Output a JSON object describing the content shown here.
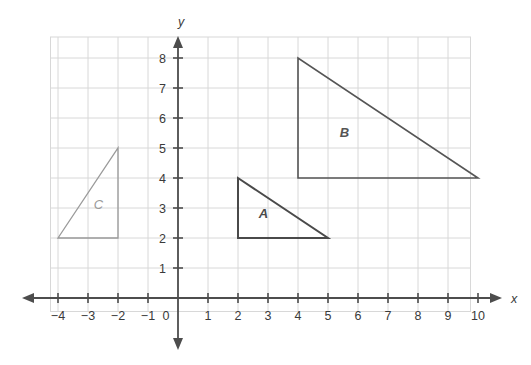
{
  "chart_data": {
    "type": "scatter",
    "title": "",
    "xlabel": "x",
    "ylabel": "y",
    "xlim": [
      -4,
      10
    ],
    "ylim": [
      0,
      8
    ],
    "grid": true,
    "legend": "none",
    "x_ticks": [
      "−4",
      "−3",
      "−2",
      "−1",
      "0",
      "1",
      "2",
      "3",
      "4",
      "5",
      "6",
      "7",
      "8",
      "9",
      "10"
    ],
    "x_tick_values": [
      -4,
      -3,
      -2,
      -1,
      0,
      1,
      2,
      3,
      4,
      5,
      6,
      7,
      8,
      9,
      10
    ],
    "y_ticks": [
      "1",
      "2",
      "3",
      "4",
      "5",
      "6",
      "7",
      "8"
    ],
    "y_tick_values": [
      1,
      2,
      3,
      4,
      5,
      6,
      7,
      8
    ],
    "origin_label": "0",
    "shapes": [
      {
        "name": "A",
        "label": "A",
        "type": "triangle",
        "vertices": [
          [
            2,
            4
          ],
          [
            2,
            2
          ],
          [
            5,
            2
          ]
        ],
        "label_position": [
          2.85,
          2.85
        ],
        "stroke": "#4a4a4a",
        "stroke_width": 2,
        "fill": "none"
      },
      {
        "name": "B",
        "label": "B",
        "type": "triangle",
        "vertices": [
          [
            4,
            8
          ],
          [
            4,
            4
          ],
          [
            10,
            4
          ]
        ],
        "label_position": [
          5.55,
          5.55
        ],
        "stroke": "#555555",
        "stroke_width": 1.6,
        "fill": "none"
      },
      {
        "name": "C",
        "label": "C",
        "type": "triangle",
        "vertices": [
          [
            -2,
            5
          ],
          [
            -2,
            2
          ],
          [
            -4,
            2
          ]
        ],
        "label_position": [
          -2.65,
          3.15
        ],
        "stroke": "#9a9a9a",
        "stroke_width": 1.3,
        "fill": "none"
      }
    ]
  },
  "axes": {
    "x_axis_label": "x",
    "y_axis_label": "y",
    "x_axis_color": "#4d4d4d",
    "y_axis_color": "#4d4d4d",
    "grid_color": "#d8d8d8",
    "tick_label_color": "#3a3a3a"
  },
  "artifacts": {
    "ghost_line_1": "",
    "ghost_line_2": ""
  }
}
